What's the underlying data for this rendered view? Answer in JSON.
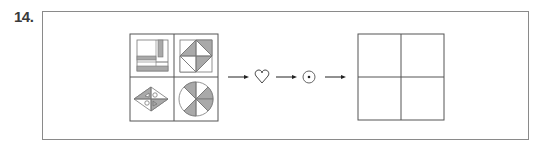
{
  "question": {
    "number_label": "14."
  },
  "diagram": {
    "colors": {
      "stroke": "#555555",
      "fill_gray": "#a9a9a9",
      "frame": "#8a8a8a"
    },
    "source_grid": {
      "cells": [
        {
          "position": "top-left",
          "figure": "square with vertical and horizontal shaded bars"
        },
        {
          "position": "top-right",
          "figure": "square with inscribed diamond, alternating shaded triangles"
        },
        {
          "position": "bottom-left",
          "figure": "rhombus with shaded triangles and small circles"
        },
        {
          "position": "bottom-right",
          "figure": "circle divided into 8 sectors, alternating shaded"
        }
      ]
    },
    "operations": [
      {
        "symbol": "♡",
        "icon": "heart-icon"
      },
      {
        "symbol": "⊙",
        "icon": "circled-dot-icon"
      }
    ],
    "arrow_symbol": "→",
    "answer_grid": {
      "cells": [
        "",
        "",
        "",
        ""
      ]
    }
  }
}
